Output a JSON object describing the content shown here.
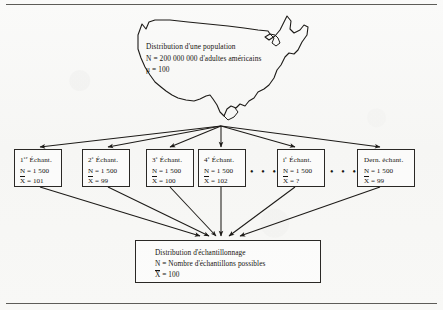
{
  "figure": {
    "population": {
      "title": "Distribution d'une population",
      "size_line": "N = 200 000 000 d'adultes américains",
      "mean_line": "μ = 100",
      "map_icon": "usa-map-outline"
    },
    "samples": [
      {
        "title_num": "1",
        "title_ord": "er",
        "title_rest": " Échant.",
        "n_line": "N = 1 500",
        "mean_prefix": "X",
        "mean_rest": " = 101"
      },
      {
        "title_num": "2",
        "title_ord": "e",
        "title_rest": " Échant.",
        "n_line": "N = 1 500",
        "mean_prefix": "X",
        "mean_rest": " = 99"
      },
      {
        "title_num": "3",
        "title_ord": "e",
        "title_rest": " Échant.",
        "n_line": "N = 1 500",
        "mean_prefix": "X",
        "mean_rest": " = 100"
      },
      {
        "title_num": "4",
        "title_ord": "e",
        "title_rest": " Échant.",
        "n_line": "N = 1 500",
        "mean_prefix": "X",
        "mean_rest": " = 102"
      },
      {
        "title_num": "i",
        "title_ord": "e",
        "title_rest": " Échant.",
        "n_line": "N = 1 500",
        "mean_prefix": "X",
        "mean_rest": " = ?"
      },
      {
        "title_num": "",
        "title_ord": "",
        "title_rest": "Dern. échant.",
        "n_line": "N = 1 500",
        "mean_prefix": "X",
        "mean_rest": " = 99"
      }
    ],
    "ellipsis": "• • •",
    "sampling_distribution": {
      "title": "Distribution d'échantillonnage",
      "count_line": "N = Nombre d'échantillons possibles",
      "mean_prefix": "X",
      "mean_rest": " = 100"
    },
    "colors": {
      "ink": "#15130f",
      "rule": "#5d5c58",
      "paper": "#f8f8f7"
    }
  }
}
